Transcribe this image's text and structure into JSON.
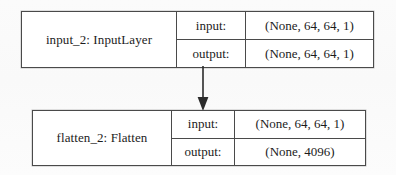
{
  "diagram": {
    "type": "keras-model-plot",
    "nodes": [
      {
        "id": "input_2",
        "name": "input_2: InputLayer",
        "input_label": "input:",
        "input_shape": "(None, 64, 64, 1)",
        "output_label": "output:",
        "output_shape": "(None, 64, 64, 1)"
      },
      {
        "id": "flatten_2",
        "name": "flatten_2: Flatten",
        "input_label": "input:",
        "input_shape": "(None, 64, 64, 1)",
        "output_label": "output:",
        "output_shape": "(None, 4096)"
      }
    ],
    "edges": [
      {
        "icon": "arrow-down-icon",
        "from": "input_2",
        "to": "flatten_2"
      }
    ],
    "colors": {
      "border": "#4a4a4a",
      "node_fill": "#ffffff",
      "text": "#1c1c1c",
      "background": "#fcfcfc",
      "arrow": "#2b2b2b"
    }
  }
}
